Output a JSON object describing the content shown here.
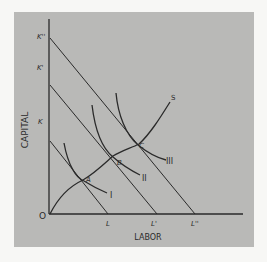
{
  "diagram": {
    "type": "isoquant-isocost-expansion-path",
    "axes": {
      "y_label": "CAPITAL",
      "x_label": "LABOR",
      "origin_label": "O"
    },
    "capital_intercepts": [
      "K",
      "K'",
      "K''"
    ],
    "labor_intercepts": [
      "L",
      "L'",
      "L''"
    ],
    "isocost_lines": [
      {
        "from": "K",
        "to": "L"
      },
      {
        "from": "K'",
        "to": "L'"
      },
      {
        "from": "K''",
        "to": "L''"
      }
    ],
    "isoquants": [
      {
        "label": "I",
        "tangent_point": "A"
      },
      {
        "label": "II",
        "tangent_point": "B"
      },
      {
        "label": "III",
        "tangent_point": "C"
      }
    ],
    "tangency_points": [
      "A",
      "B",
      "C"
    ],
    "expansion_path_label": "S",
    "colors": {
      "panel_background": "#b9b9b7",
      "line_color": "#2a2a2a",
      "page_background": "#f7f7f5"
    }
  }
}
